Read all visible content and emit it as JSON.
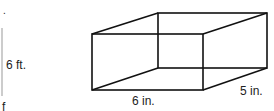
{
  "left_figure": {
    "height_label": "6 ft.",
    "partial_bottom_text": "f",
    "partial_top_mark": "."
  },
  "box": {
    "length_label": "6 in.",
    "depth_label": "5 in.",
    "stroke_color": "#111111"
  }
}
